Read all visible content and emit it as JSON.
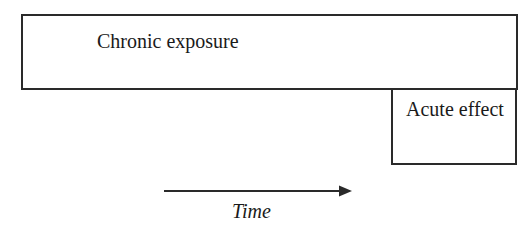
{
  "diagram": {
    "chronic_box": {
      "label": "Chronic exposure"
    },
    "acute_box": {
      "label": "Acute effect"
    },
    "axis": {
      "label": "Time",
      "direction": "right"
    }
  }
}
